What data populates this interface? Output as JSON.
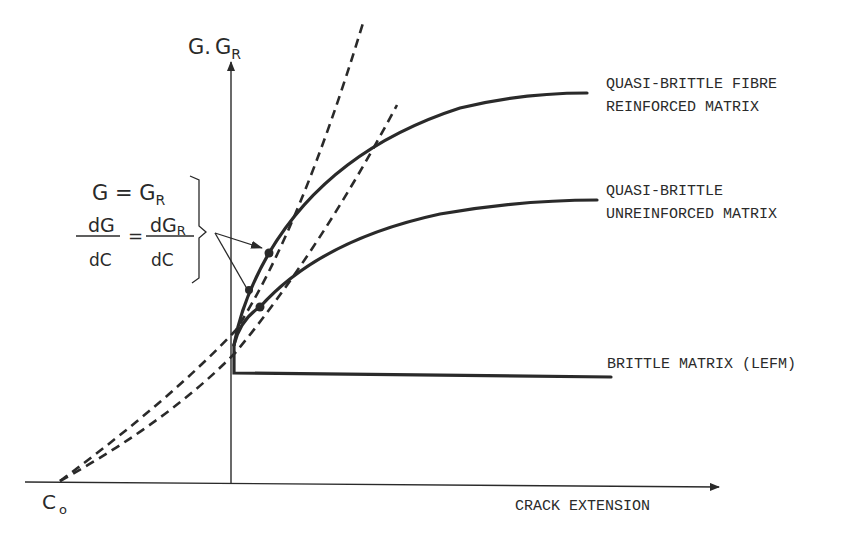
{
  "diagram": {
    "type": "crack-resistance-curves",
    "y_axis": {
      "label_main": "G.",
      "label_sub_base": "G",
      "label_sub": "R"
    },
    "x_axis": {
      "label": "CRACK EXTENSION"
    },
    "origin_label": {
      "base": "C",
      "sub": "o"
    },
    "condition": {
      "line1_left": "G = G",
      "line1_sub": "R",
      "frac1_num": "dG",
      "frac1_den": "dC",
      "equals": "=",
      "frac2_num": "dG",
      "frac2_num_sub": "R",
      "frac2_den": "dC"
    },
    "curves": [
      {
        "id": "fibre",
        "label_line1": "QUASI-BRITTLE FIBRE",
        "label_line2": "REINFORCED MATRIX"
      },
      {
        "id": "unreinforced",
        "label_line1": "QUASI-BRITTLE",
        "label_line2": "UNREINFORCED MATRIX"
      },
      {
        "id": "brittle",
        "label_line1": "BRITTLE MATRIX (LEFM)"
      }
    ],
    "colors": {
      "ink": "#2a2a2a",
      "background": "#ffffff"
    }
  }
}
